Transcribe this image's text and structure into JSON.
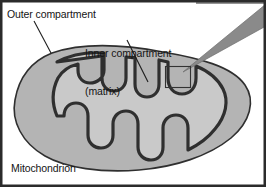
{
  "figure": {
    "title_label": "Mitochondrion",
    "frame_color": "#2b2b2b",
    "background_color": "#ffffff",
    "labels": {
      "outer_compartment": "Outer compartment",
      "inner_compartment_line1": "Inner compartment",
      "inner_compartment_line2": "(matrix)"
    },
    "colors": {
      "outer_compartment_fill": "#b4b4b4",
      "matrix_fill": "#c9c9c9",
      "membrane_stroke": "#2f2f2f",
      "pointer_fill": "#8a8a8a",
      "leader_line": "#1c1c1c",
      "detail_box_stroke": "#333333",
      "text": "#141414"
    },
    "icons": {
      "pointer": "wedge-pointer-icon",
      "detail_box": "detail-callout-box-icon",
      "leader_outer": "leader-line-icon",
      "leader_inner": "leader-line-icon"
    },
    "structures": {
      "organelle_name": "mitochondrion",
      "outer_membrane": "outer membrane",
      "inner_membrane": "inner membrane with cristae",
      "cristae_count": 9
    }
  }
}
